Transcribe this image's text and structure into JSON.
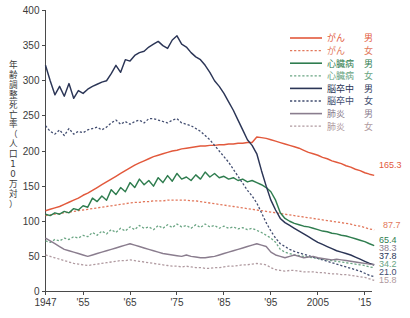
{
  "chart_data": {
    "type": "line",
    "title": "",
    "xlabel": "",
    "ylabel": "年齢調整死亡率（人口10万対）",
    "ylabel_chars": [
      "年",
      "齢",
      "調",
      "整",
      "死",
      "亡",
      "率",
      "（",
      "人",
      "口",
      "1",
      "0",
      "万",
      "対",
      "）"
    ],
    "xlim": [
      1947,
      2016
    ],
    "ylim": [
      0,
      400
    ],
    "grid": false,
    "legend_position": "top-right",
    "y_ticks": [
      0,
      50,
      100,
      150,
      200,
      250,
      300,
      350,
      400
    ],
    "y_tick_labels": [
      "0",
      "50",
      "100",
      "150",
      "200",
      "250",
      "300",
      "350",
      "400"
    ],
    "x_ticks": [
      1947,
      1955,
      1965,
      1975,
      1985,
      1995,
      2005,
      2015
    ],
    "x_tick_labels": [
      "1947",
      "'55",
      "'65",
      "'75",
      "'85",
      "'95",
      "2005",
      "'15"
    ],
    "x_start": 1947,
    "colors": {
      "cancer": "#e2593c",
      "cancer_female": "#e2785c",
      "heart": "#2f7d4f",
      "heart_female": "#6aa583",
      "stroke": "#2b3556",
      "stroke_female": "#424d70",
      "pneumonia": "#8a7d8e",
      "pneumonia_female": "#b09aa0"
    },
    "series": [
      {
        "name": "がん　男",
        "key": "cancer-male",
        "legend_disease": "がん",
        "legend_sex": "男",
        "color": "#e2593c",
        "dash": "solid",
        "end_label": "165.3",
        "end_value": 165.3,
        "values": [
          115,
          117,
          119,
          121,
          124,
          127,
          130,
          133,
          137,
          140,
          144,
          148,
          152,
          156,
          160,
          164,
          168,
          172,
          176,
          180,
          183,
          186,
          189,
          192,
          194,
          196,
          198,
          200,
          201,
          203,
          204,
          205,
          206,
          207,
          207,
          208,
          208,
          209,
          209,
          210,
          210,
          211,
          211,
          212,
          212,
          220,
          219,
          218,
          216,
          214,
          212,
          210,
          208,
          206,
          204,
          201,
          198,
          196,
          194,
          191,
          189,
          186,
          184,
          182,
          179,
          177,
          174,
          172,
          169,
          167,
          165.3
        ]
      },
      {
        "name": "がん　女",
        "key": "cancer-female",
        "legend_disease": "がん",
        "legend_sex": "女",
        "color": "#e2785c",
        "dash": "dotted",
        "end_label": "87.7",
        "end_value": 87.7,
        "values": [
          108,
          109,
          110,
          111,
          112,
          113,
          114,
          115,
          116,
          117,
          118,
          119,
          120,
          121,
          122,
          123,
          124,
          125,
          126,
          127,
          127,
          128,
          128,
          129,
          129,
          129,
          130,
          130,
          130,
          130,
          130,
          129,
          129,
          128,
          127,
          126,
          125,
          124,
          123,
          122,
          121,
          120,
          119,
          118,
          117,
          116,
          115,
          114,
          113,
          112,
          111,
          110,
          109,
          108,
          107,
          106,
          105,
          104,
          103,
          102,
          101,
          100,
          99,
          98,
          97,
          96,
          94,
          93,
          91,
          89,
          87.7
        ]
      },
      {
        "name": "心臓病　男",
        "key": "heart-male",
        "legend_disease": "心臓病",
        "legend_sex": "男",
        "color": "#2f7d4f",
        "dash": "solid",
        "end_label": "65.4",
        "end_value": 65.4,
        "values": [
          110,
          108,
          112,
          110,
          114,
          112,
          118,
          116,
          122,
          120,
          133,
          128,
          136,
          130,
          145,
          138,
          148,
          142,
          155,
          148,
          160,
          152,
          158,
          150,
          162,
          155,
          165,
          157,
          168,
          160,
          163,
          158,
          166,
          160,
          170,
          163,
          168,
          162,
          164,
          160,
          162,
          158,
          160,
          156,
          158,
          155,
          152,
          148,
          142,
          130,
          112,
          104,
          100,
          97,
          95,
          93,
          92,
          90,
          88,
          86,
          85,
          83,
          82,
          80,
          79,
          77,
          75,
          73,
          71,
          68,
          65.4
        ]
      },
      {
        "name": "心臓病　女",
        "key": "heart-female",
        "legend_disease": "心臓病",
        "legend_sex": "女",
        "color": "#6aa583",
        "dash": "dotted",
        "end_label": "34.2",
        "end_value": 34.2,
        "values": [
          72,
          70,
          74,
          72,
          76,
          74,
          78,
          76,
          80,
          78,
          84,
          80,
          86,
          82,
          88,
          84,
          90,
          86,
          92,
          88,
          94,
          90,
          92,
          88,
          94,
          90,
          95,
          91,
          96,
          92,
          94,
          90,
          95,
          91,
          96,
          92,
          94,
          90,
          93,
          90,
          92,
          89,
          91,
          88,
          90,
          87,
          84,
          80,
          76,
          70,
          60,
          56,
          54,
          52,
          51,
          50,
          49,
          48,
          47,
          46,
          45,
          44,
          43,
          42,
          41,
          40,
          39,
          38,
          37,
          35,
          34.2
        ]
      },
      {
        "name": "脳卒中　男",
        "key": "stroke-male",
        "legend_disease": "脳卒中",
        "legend_sex": "男",
        "color": "#2b3556",
        "dash": "solid",
        "end_label": "37.8",
        "end_value": 37.8,
        "values": [
          322,
          300,
          280,
          292,
          278,
          296,
          275,
          286,
          282,
          288,
          292,
          295,
          298,
          300,
          310,
          322,
          312,
          330,
          328,
          336,
          340,
          342,
          348,
          352,
          356,
          350,
          346,
          358,
          364,
          352,
          348,
          340,
          334,
          330,
          322,
          312,
          300,
          292,
          282,
          270,
          258,
          244,
          230,
          216,
          208,
          196,
          172,
          150,
          130,
          116,
          104,
          98,
          94,
          90,
          86,
          82,
          78,
          74,
          70,
          67,
          64,
          61,
          58,
          56,
          54,
          52,
          49,
          46,
          43,
          40,
          37.8
        ]
      },
      {
        "name": "脳卒中　女",
        "key": "stroke-female",
        "legend_disease": "脳卒中",
        "legend_sex": "女",
        "color": "#424d70",
        "dash": "dotted",
        "end_label": "21.0",
        "end_value": 21.0,
        "values": [
          236,
          228,
          224,
          230,
          222,
          232,
          224,
          228,
          226,
          230,
          232,
          234,
          230,
          234,
          240,
          244,
          238,
          242,
          238,
          242,
          244,
          240,
          246,
          246,
          244,
          242,
          240,
          244,
          246,
          240,
          238,
          236,
          232,
          228,
          222,
          216,
          208,
          200,
          192,
          184,
          174,
          164,
          154,
          144,
          136,
          126,
          112,
          98,
          86,
          76,
          68,
          64,
          60,
          57,
          55,
          53,
          51,
          49,
          47,
          45,
          43,
          41,
          39,
          37,
          35,
          33,
          31,
          29,
          26,
          23,
          21.0
        ]
      },
      {
        "name": "肺炎　男",
        "key": "pneumonia-male",
        "legend_disease": "肺炎",
        "legend_sex": "男",
        "color": "#8a7d8e",
        "dash": "solid",
        "end_label": "38.3",
        "end_value": 38.3,
        "values": [
          76,
          72,
          68,
          64,
          60,
          58,
          56,
          54,
          52,
          50,
          52,
          54,
          56,
          58,
          60,
          62,
          64,
          66,
          68,
          66,
          64,
          62,
          60,
          58,
          56,
          54,
          53,
          52,
          51,
          50,
          52,
          50,
          49,
          48,
          48,
          49,
          50,
          52,
          54,
          56,
          58,
          60,
          62,
          64,
          66,
          68,
          66,
          64,
          56,
          52,
          50,
          48,
          50,
          52,
          50,
          48,
          49,
          50,
          48,
          47,
          46,
          45,
          46,
          45,
          44,
          43,
          42,
          41,
          40,
          39,
          38.3
        ]
      },
      {
        "name": "肺炎　女",
        "key": "pneumonia-female",
        "legend_disease": "肺炎",
        "legend_sex": "女",
        "color": "#b09aa0",
        "dash": "dotted",
        "end_label": "15.8",
        "end_value": 15.8,
        "values": [
          52,
          50,
          48,
          46,
          44,
          42,
          40,
          39,
          38,
          37,
          38,
          39,
          40,
          41,
          42,
          43,
          44,
          44,
          45,
          44,
          43,
          42,
          41,
          40,
          39,
          38,
          37,
          36,
          36,
          35,
          36,
          35,
          34,
          34,
          33,
          33,
          34,
          34,
          35,
          36,
          36,
          37,
          38,
          38,
          39,
          40,
          39,
          38,
          34,
          31,
          30,
          29,
          30,
          30,
          29,
          28,
          28,
          28,
          27,
          27,
          26,
          25,
          25,
          24,
          24,
          23,
          22,
          21,
          20,
          18,
          15.8
        ]
      }
    ],
    "end_labels": [
      {
        "text": "165.3",
        "value": 165.3,
        "color": "#e2593c",
        "series": "cancer-male"
      },
      {
        "text": "87.7",
        "value": 87.7,
        "color": "#e2785c",
        "series": "cancer-female"
      },
      {
        "text": "65.4",
        "value": 65.4,
        "color": "#2f7d4f",
        "series": "heart-male"
      },
      {
        "text": "38.3",
        "value": 38.3,
        "color": "#8a7d8e",
        "series": "pneumonia-male"
      },
      {
        "text": "37.8",
        "value": 37.8,
        "color": "#2b3556",
        "series": "stroke-male"
      },
      {
        "text": "34.2",
        "value": 34.2,
        "color": "#6aa583",
        "series": "heart-female"
      },
      {
        "text": "21.0",
        "value": 21.0,
        "color": "#424d70",
        "series": "stroke-female"
      },
      {
        "text": "15.8",
        "value": 15.8,
        "color": "#b09aa0",
        "series": "pneumonia-female"
      }
    ]
  }
}
